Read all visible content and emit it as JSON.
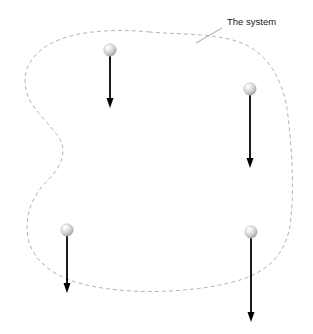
{
  "figure": {
    "title": "The system",
    "width": 313,
    "height": 334,
    "background_color": "#ffffff"
  },
  "annotations": {
    "system_label": {
      "text": "The system",
      "x": 227,
      "y": 25,
      "color": "#1a1a1a",
      "font_size": 9.5,
      "leader_line": {
        "x1": 222,
        "y1": 28,
        "x2": 196,
        "y2": 43,
        "color": "#9a9a9a"
      }
    }
  },
  "boundary": {
    "name": "system-boundary",
    "style": "dashed",
    "color": "#b4b4b4",
    "stroke_width": 1,
    "dash_pattern": "4,3",
    "path": "M 150 32 C 108 28 72 32 50 44 C 30 55 22 72 26 90 C 30 108 48 122 58 136 C 68 150 62 166 48 180 C 32 196 24 216 28 238 C 33 262 56 280 96 287 C 140 295 200 292 240 280 C 272 270 288 250 291 218 C 294 186 292 150 288 116 C 284 82 270 56 244 44 C 218 33 186 35 150 32 Z"
  },
  "particles": [
    {
      "name": "sphere-1",
      "cx": 110,
      "cy": 50,
      "r": 6.2,
      "color": "#d8d8d8",
      "highlight_color": "#ffffff",
      "arrow": {
        "x": 110,
        "y_start": 56,
        "y_end": 108,
        "color": "#000000",
        "stroke_width": 1.8,
        "head_width": 7,
        "head_length": 10
      }
    },
    {
      "name": "sphere-2",
      "cx": 250,
      "cy": 89,
      "r": 6.2,
      "color": "#d8d8d8",
      "highlight_color": "#ffffff",
      "arrow": {
        "x": 250,
        "y_start": 95,
        "y_end": 168,
        "color": "#000000",
        "stroke_width": 1.8,
        "head_width": 7,
        "head_length": 10
      }
    },
    {
      "name": "sphere-3",
      "cx": 67,
      "cy": 230,
      "r": 6.2,
      "color": "#d8d8d8",
      "highlight_color": "#ffffff",
      "arrow": {
        "x": 67,
        "y_start": 236,
        "y_end": 293,
        "color": "#000000",
        "stroke_width": 1.8,
        "head_width": 7,
        "head_length": 10
      }
    },
    {
      "name": "sphere-4",
      "cx": 251,
      "cy": 232,
      "r": 6.2,
      "color": "#d8d8d8",
      "highlight_color": "#ffffff",
      "arrow": {
        "x": 251,
        "y_start": 238,
        "y_end": 322,
        "color": "#000000",
        "stroke_width": 1.8,
        "head_width": 7,
        "head_length": 10
      }
    }
  ]
}
